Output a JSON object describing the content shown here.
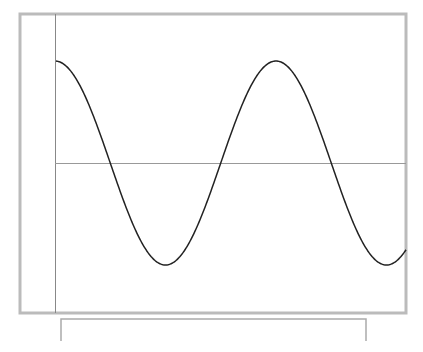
{
  "chart_data": {
    "type": "line",
    "title": "",
    "xlabel": "",
    "ylabel": "",
    "grid": false,
    "legend": null,
    "series": [
      {
        "name": "cosine wave",
        "function": "y = A*cos(2*pi*(x - x0)/period)",
        "amplitude_px": 102,
        "period_px": 221,
        "phase_peak_x_px": 55,
        "center_y_px": 163,
        "x_start_px": 56,
        "x_end_px": 406,
        "key_points": [
          {
            "label": "start (near max)",
            "x": 56,
            "y": 64
          },
          {
            "label": "zero crossing",
            "x": 110,
            "y": 163
          },
          {
            "label": "min",
            "x": 165,
            "y": 264
          },
          {
            "label": "zero crossing",
            "x": 220,
            "y": 163
          },
          {
            "label": "max",
            "x": 276,
            "y": 61
          },
          {
            "label": "zero crossing",
            "x": 331,
            "y": 163
          },
          {
            "label": "min",
            "x": 386,
            "y": 266
          },
          {
            "label": "end",
            "x": 406,
            "y": 252
          }
        ],
        "color": "#222222"
      }
    ],
    "normalized": {
      "x_cycles": [
        0,
        0.25,
        0.5,
        0.75,
        1.0,
        1.25,
        1.5,
        1.59
      ],
      "y_values": [
        1,
        0,
        -1,
        0,
        1,
        0,
        -1,
        -0.85
      ]
    },
    "axes": {
      "x_axis_y_px": 163,
      "y_axis_x_px": 55,
      "x_axis_color": "#999999",
      "y_axis_color": "#888888"
    }
  },
  "frame": {
    "outer_border": {
      "x": 20,
      "y": 14,
      "w": 386,
      "h": 299,
      "color": "#bbbbbb",
      "thickness": 3
    },
    "lower_box": {
      "x": 61,
      "y": 319,
      "w": 305,
      "h": 22,
      "color": "#aaaaaa"
    }
  }
}
